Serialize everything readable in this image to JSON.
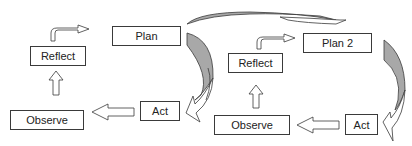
{
  "diagram": {
    "cycles": [
      {
        "id": "cycle-1",
        "nodes": {
          "plan": "Plan",
          "act": "Act",
          "observe": "Observe",
          "reflect": "Reflect"
        }
      },
      {
        "id": "cycle-2",
        "nodes": {
          "plan": "Plan 2",
          "act": "Act",
          "observe": "Observe",
          "reflect": "Reflect"
        }
      }
    ],
    "edges": [
      {
        "from": "cycle-1.plan",
        "to": "cycle-1.act",
        "style": "curved-shaded"
      },
      {
        "from": "cycle-1.act",
        "to": "cycle-1.observe",
        "style": "block-arrow"
      },
      {
        "from": "cycle-1.observe",
        "to": "cycle-1.reflect",
        "style": "block-arrow"
      },
      {
        "from": "cycle-1.reflect",
        "to": "cycle-1.plan",
        "style": "bent-arrow"
      },
      {
        "from": "cycle-1.plan",
        "to": "cycle-2.plan",
        "style": "curved-shaded"
      },
      {
        "from": "cycle-2.plan",
        "to": "cycle-2.act",
        "style": "curved-shaded"
      },
      {
        "from": "cycle-2.act",
        "to": "cycle-2.observe",
        "style": "block-arrow"
      },
      {
        "from": "cycle-2.observe",
        "to": "cycle-2.reflect",
        "style": "block-arrow"
      },
      {
        "from": "cycle-2.reflect",
        "to": "cycle-2.plan",
        "style": "bent-arrow"
      }
    ],
    "colors": {
      "stroke": "#3a3a3a",
      "shade": "#a8a8a8",
      "background": "#ffffff"
    }
  }
}
